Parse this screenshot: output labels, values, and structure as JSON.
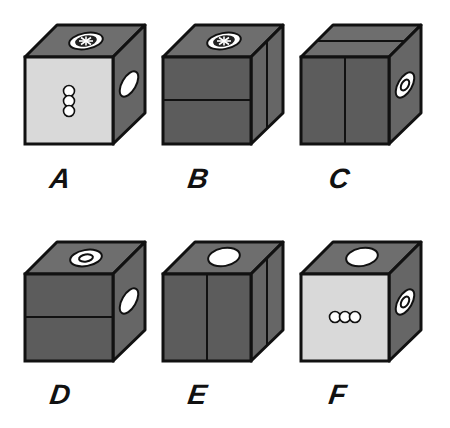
{
  "colors": {
    "outline": "#111111",
    "dark_face": "#5c5c5c",
    "top_face": "#6e6e6e",
    "side_face": "#666666",
    "light_face": "#d9d9d9",
    "symbol_fill": "#ffffff"
  },
  "options": [
    {
      "label": "A",
      "front": {
        "shade": "light",
        "symbol": "three-circles-vertical"
      },
      "top": {
        "shade": "dark",
        "symbol": "asterisk-oval"
      },
      "right": {
        "shade": "dark",
        "symbol": "plain-oval"
      }
    },
    {
      "label": "B",
      "front": {
        "shade": "dark",
        "symbol": "horizontal-line"
      },
      "top": {
        "shade": "dark",
        "symbol": "asterisk-oval"
      },
      "right": {
        "shade": "dark",
        "symbol": "vertical-line"
      }
    },
    {
      "label": "C",
      "front": {
        "shade": "dark",
        "symbol": "vertical-line"
      },
      "top": {
        "shade": "dark",
        "symbol": "line-across"
      },
      "right": {
        "shade": "dark",
        "symbol": "ring-oval"
      }
    },
    {
      "label": "D",
      "front": {
        "shade": "dark",
        "symbol": "horizontal-line"
      },
      "top": {
        "shade": "dark",
        "symbol": "ring-oval"
      },
      "right": {
        "shade": "dark",
        "symbol": "plain-oval"
      }
    },
    {
      "label": "E",
      "front": {
        "shade": "dark",
        "symbol": "vertical-line"
      },
      "top": {
        "shade": "dark",
        "symbol": "plain-oval"
      },
      "right": {
        "shade": "dark",
        "symbol": "vertical-line"
      }
    },
    {
      "label": "F",
      "front": {
        "shade": "light",
        "symbol": "three-circles-horizontal"
      },
      "top": {
        "shade": "dark",
        "symbol": "plain-oval"
      },
      "right": {
        "shade": "dark",
        "symbol": "ring-oval"
      }
    }
  ]
}
